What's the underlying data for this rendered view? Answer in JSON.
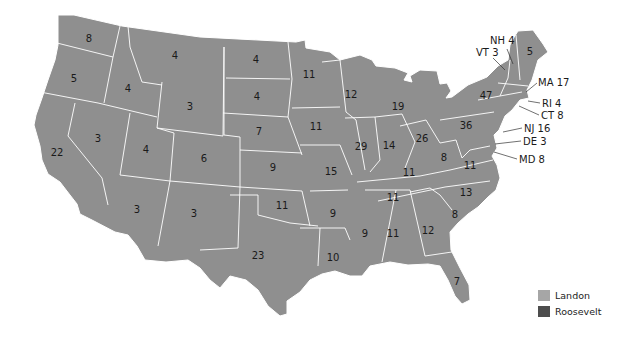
{
  "map": {
    "title": "1936 Electoral Map (Landon / Roosevelt)",
    "colors": {
      "landon": "#a6a6a6",
      "roosevelt": "#4d4d4d",
      "state_fill": "#8f8f8f",
      "border": "#ffffff"
    },
    "states": [
      {
        "abbr": "WA",
        "ev": "8",
        "x": 89,
        "y": 39
      },
      {
        "abbr": "OR",
        "ev": "5",
        "x": 74,
        "y": 79
      },
      {
        "abbr": "CA",
        "ev": "22",
        "x": 57,
        "y": 153
      },
      {
        "abbr": "ID",
        "ev": "4",
        "x": 128,
        "y": 89
      },
      {
        "abbr": "NV",
        "ev": "3",
        "x": 98,
        "y": 139
      },
      {
        "abbr": "MT",
        "ev": "4",
        "x": 175,
        "y": 56
      },
      {
        "abbr": "WY",
        "ev": "3",
        "x": 190,
        "y": 107
      },
      {
        "abbr": "UT",
        "ev": "4",
        "x": 146,
        "y": 150
      },
      {
        "abbr": "AZ",
        "ev": "3",
        "x": 137,
        "y": 210
      },
      {
        "abbr": "CO",
        "ev": "6",
        "x": 204,
        "y": 159
      },
      {
        "abbr": "NM",
        "ev": "3",
        "x": 194,
        "y": 214
      },
      {
        "abbr": "ND",
        "ev": "4",
        "x": 256,
        "y": 60
      },
      {
        "abbr": "SD",
        "ev": "4",
        "x": 257,
        "y": 97
      },
      {
        "abbr": "NE",
        "ev": "7",
        "x": 259,
        "y": 132
      },
      {
        "abbr": "KS",
        "ev": "9",
        "x": 273,
        "y": 168
      },
      {
        "abbr": "OK",
        "ev": "11",
        "x": 282,
        "y": 206
      },
      {
        "abbr": "TX",
        "ev": "23",
        "x": 258,
        "y": 256
      },
      {
        "abbr": "MN",
        "ev": "11",
        "x": 309,
        "y": 75
      },
      {
        "abbr": "IA",
        "ev": "11",
        "x": 316,
        "y": 127
      },
      {
        "abbr": "MO",
        "ev": "15",
        "x": 331,
        "y": 172
      },
      {
        "abbr": "AR",
        "ev": "9",
        "x": 333,
        "y": 214
      },
      {
        "abbr": "LA",
        "ev": "10",
        "x": 333,
        "y": 258
      },
      {
        "abbr": "WI",
        "ev": "12",
        "x": 351,
        "y": 95
      },
      {
        "abbr": "IL",
        "ev": "29",
        "x": 361,
        "y": 147
      },
      {
        "abbr": "MI",
        "ev": "19",
        "x": 398,
        "y": 107
      },
      {
        "abbr": "IN",
        "ev": "14",
        "x": 389,
        "y": 146
      },
      {
        "abbr": "OH",
        "ev": "26",
        "x": 422,
        "y": 139
      },
      {
        "abbr": "KY",
        "ev": "11",
        "x": 409,
        "y": 173
      },
      {
        "abbr": "TN",
        "ev": "11",
        "x": 393,
        "y": 198
      },
      {
        "abbr": "MS",
        "ev": "9",
        "x": 365,
        "y": 234
      },
      {
        "abbr": "AL",
        "ev": "11",
        "x": 393,
        "y": 234
      },
      {
        "abbr": "GA",
        "ev": "12",
        "x": 428,
        "y": 231
      },
      {
        "abbr": "FL",
        "ev": "7",
        "x": 457,
        "y": 282
      },
      {
        "abbr": "SC",
        "ev": "8",
        "x": 455,
        "y": 215
      },
      {
        "abbr": "NC",
        "ev": "13",
        "x": 466,
        "y": 193
      },
      {
        "abbr": "VA",
        "ev": "11",
        "x": 470,
        "y": 166
      },
      {
        "abbr": "WV",
        "ev": "8",
        "x": 444,
        "y": 158
      },
      {
        "abbr": "PA",
        "ev": "36",
        "x": 466,
        "y": 126
      },
      {
        "abbr": "NY",
        "ev": "47",
        "x": 486,
        "y": 96
      },
      {
        "abbr": "ME",
        "ev": "5",
        "x": 530,
        "y": 52
      }
    ],
    "callouts": [
      {
        "text": "NH 4",
        "x": 490,
        "y": 36
      },
      {
        "text": "VT 3",
        "x": 476,
        "y": 48
      },
      {
        "text": "MA 17",
        "x": 538,
        "y": 78
      },
      {
        "text": "RI 4",
        "x": 542,
        "y": 99
      },
      {
        "text": "CT 8",
        "x": 541,
        "y": 111
      },
      {
        "text": "NJ 16",
        "x": 524,
        "y": 124
      },
      {
        "text": "DE 3",
        "x": 523,
        "y": 137
      },
      {
        "text": "MD 8",
        "x": 519,
        "y": 155
      }
    ]
  },
  "legend": {
    "items": [
      {
        "label": "Landon",
        "color": "#a6a6a6"
      },
      {
        "label": "Roosevelt",
        "color": "#4d4d4d"
      }
    ]
  }
}
